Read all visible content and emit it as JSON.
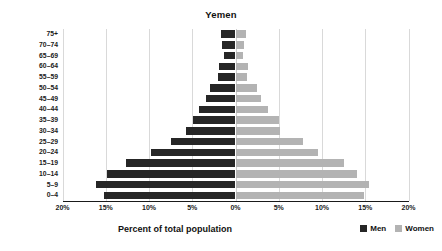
{
  "chart_data": {
    "type": "bar",
    "subtype": "population-pyramid",
    "title": "Yemen",
    "xlabel": "Percent of total population",
    "ylabel": "Age",
    "categories": [
      "0–4",
      "5–9",
      "10–14",
      "15–19",
      "20–24",
      "25–29",
      "30–34",
      "35–39",
      "40–44",
      "45–49",
      "50–54",
      "55–59",
      "60–64",
      "65–69",
      "70–74",
      "75+"
    ],
    "series": [
      {
        "name": "Men",
        "color": "#262626",
        "direction": "left",
        "values": [
          15.2,
          16.1,
          14.8,
          12.7,
          9.8,
          7.4,
          5.7,
          4.9,
          4.25,
          3.4,
          2.9,
          2.05,
          1.9,
          1.3,
          1.55,
          1.65
        ]
      },
      {
        "name": "Women",
        "color": "#b3b3b3",
        "direction": "right",
        "values": [
          14.9,
          15.4,
          14.0,
          12.6,
          9.5,
          7.8,
          5.1,
          5.0,
          3.7,
          2.9,
          2.5,
          1.35,
          1.5,
          0.85,
          1.0,
          1.2
        ]
      }
    ],
    "xticks": [
      "20%",
      "15%",
      "10%",
      "5%",
      "0%",
      "5%",
      "10%",
      "15%",
      "20%"
    ],
    "xtick_values": [
      -20,
      -15,
      -10,
      -5,
      0,
      5,
      10,
      15,
      20
    ],
    "xlim": [
      -20,
      20
    ],
    "grid": true,
    "legend_position": "bottom-right",
    "legend": [
      {
        "label": "Men",
        "color": "#262626"
      },
      {
        "label": "Women",
        "color": "#b3b3b3"
      }
    ]
  }
}
